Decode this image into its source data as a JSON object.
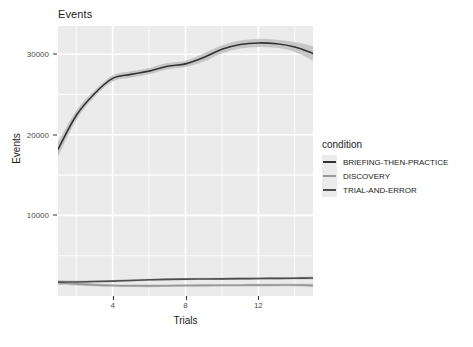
{
  "chart_data": {
    "type": "line",
    "title": "Events",
    "xlabel": "Trials",
    "ylabel": "Events",
    "xlim": [
      1,
      15
    ],
    "ylim": [
      0,
      33500
    ],
    "xticks": [
      4,
      8,
      12
    ],
    "yticks": [
      10000,
      20000,
      30000
    ],
    "ytick_labels": [
      "10000",
      "20000",
      "30000"
    ],
    "xtick_labels": [
      "4",
      "8",
      "12"
    ],
    "grid": true,
    "legend_position": "right",
    "legend_title": "condition",
    "x": [
      1,
      2,
      3,
      4,
      5,
      6,
      7,
      8,
      9,
      10,
      11,
      12,
      13,
      14,
      15
    ],
    "series": [
      {
        "name": "BRIEFING-THEN-PRACTICE",
        "color": "#333333",
        "values": [
          18200,
          22400,
          25100,
          27000,
          27500,
          27900,
          28500,
          28800,
          29600,
          30600,
          31200,
          31400,
          31300,
          30900,
          30100
        ],
        "band_lower": [
          17300,
          21800,
          24700,
          26600,
          27100,
          27500,
          28100,
          28400,
          29100,
          30100,
          30700,
          30900,
          30800,
          30300,
          29200
        ],
        "band_upper": [
          19100,
          23000,
          25500,
          27400,
          27900,
          28300,
          28900,
          29200,
          30100,
          31100,
          31700,
          31900,
          31800,
          31500,
          31000
        ]
      },
      {
        "name": "DISCOVERY",
        "color": "#999999",
        "values": [
          1650,
          1500,
          1380,
          1300,
          1270,
          1260,
          1280,
          1300,
          1320,
          1330,
          1340,
          1350,
          1355,
          1360,
          1320
        ],
        "band_lower": [
          1380,
          1300,
          1200,
          1140,
          1110,
          1100,
          1120,
          1140,
          1160,
          1170,
          1180,
          1190,
          1195,
          1190,
          1120
        ],
        "band_upper": [
          1920,
          1700,
          1560,
          1460,
          1430,
          1420,
          1440,
          1460,
          1480,
          1490,
          1500,
          1510,
          1515,
          1530,
          1520
        ]
      },
      {
        "name": "TRIAL-AND-ERROR",
        "color": "#4d4d4d",
        "values": [
          1720,
          1740,
          1790,
          1850,
          1930,
          2010,
          2060,
          2090,
          2110,
          2130,
          2150,
          2170,
          2190,
          2210,
          2230
        ],
        "band_lower": [
          1480,
          1560,
          1630,
          1700,
          1790,
          1870,
          1920,
          1950,
          1970,
          1990,
          2010,
          2030,
          2050,
          2060,
          2050
        ],
        "band_upper": [
          1960,
          1920,
          1950,
          2000,
          2070,
          2150,
          2200,
          2230,
          2250,
          2270,
          2290,
          2310,
          2330,
          2360,
          2410
        ]
      }
    ]
  },
  "panel": {
    "background": "#ebebeb",
    "gridline_color": "#ffffff"
  },
  "legend": {
    "title": "condition",
    "items": [
      {
        "label": "BRIEFING-THEN-PRACTICE",
        "color": "#333333"
      },
      {
        "label": "DISCOVERY",
        "color": "#999999"
      },
      {
        "label": "TRIAL-AND-ERROR",
        "color": "#4d4d4d"
      }
    ]
  }
}
